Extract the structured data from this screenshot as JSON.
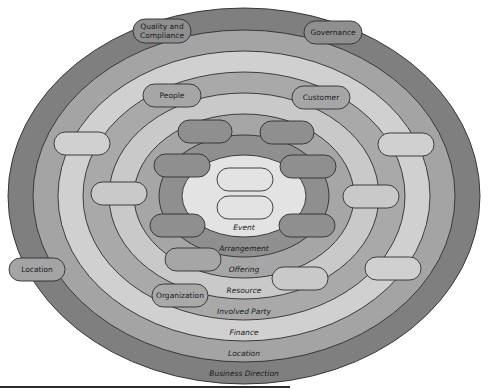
{
  "diagram": {
    "title": "",
    "center": {
      "x": 244,
      "y": 196
    },
    "rings": [
      {
        "label": "Business Direction",
        "color": "#7f7f7f",
        "rx": 236,
        "ry": 188,
        "cy": 196,
        "label_y": 376
      },
      {
        "label": "Location",
        "color": "#a4a4a4",
        "rx": 211,
        "ry": 166,
        "cy": 196,
        "label_y": 356
      },
      {
        "label": "Finance",
        "color": "#d0d0d0",
        "rx": 186,
        "ry": 145,
        "cy": 196,
        "label_y": 335
      },
      {
        "label": "Involved Party",
        "color": "#a9a9a9",
        "rx": 161,
        "ry": 124,
        "cy": 196,
        "label_y": 314
      },
      {
        "label": "Resource",
        "color": "#c9c9c9",
        "rx": 135,
        "ry": 103,
        "cy": 196,
        "label_y": 293
      },
      {
        "label": "Offering",
        "color": "#a6a6a6",
        "rx": 110,
        "ry": 82,
        "cy": 196,
        "label_y": 272
      },
      {
        "label": "Arrangement",
        "color": "#8f8f8f",
        "rx": 85,
        "ry": 61,
        "cy": 196,
        "label_y": 251
      },
      {
        "label": "Event",
        "color": "#e3e3e3",
        "rx": 62,
        "ry": 41,
        "cy": 196,
        "label_y": 230
      }
    ],
    "pills": [
      {
        "label": "Quality and Compliance",
        "lines": [
          "Quality and",
          "Compliance"
        ],
        "x": 133,
        "y": 19,
        "w": 58,
        "h": 24,
        "color": "#8f8f8f"
      },
      {
        "label": "Governance",
        "lines": [
          "Governance"
        ],
        "x": 304,
        "y": 21,
        "w": 58,
        "h": 23,
        "color": "#8f8f8f"
      },
      {
        "label": "People",
        "lines": [
          "People"
        ],
        "x": 143,
        "y": 84,
        "w": 58,
        "h": 23,
        "color": "#a6a6a6"
      },
      {
        "label": "Customer",
        "lines": [
          "Customer"
        ],
        "x": 292,
        "y": 86,
        "w": 58,
        "h": 23,
        "color": "#a6a6a6"
      },
      {
        "label": "",
        "lines": [],
        "x": 54,
        "y": 132,
        "w": 56,
        "h": 23,
        "color": "#d0d0d0"
      },
      {
        "label": "",
        "lines": [],
        "x": 378,
        "y": 133,
        "w": 56,
        "h": 23,
        "color": "#d0d0d0"
      },
      {
        "label": "",
        "lines": [],
        "x": 178,
        "y": 120,
        "w": 54,
        "h": 23,
        "color": "#8f8f8f"
      },
      {
        "label": "",
        "lines": [],
        "x": 260,
        "y": 121,
        "w": 54,
        "h": 23,
        "color": "#8f8f8f"
      },
      {
        "label": "",
        "lines": [],
        "x": 154,
        "y": 154,
        "w": 56,
        "h": 23,
        "color": "#8f8f8f"
      },
      {
        "label": "",
        "lines": [],
        "x": 280,
        "y": 155,
        "w": 56,
        "h": 23,
        "color": "#8f8f8f"
      },
      {
        "label": "",
        "lines": [],
        "x": 91,
        "y": 182,
        "w": 56,
        "h": 23,
        "color": "#c9c9c9"
      },
      {
        "label": "",
        "lines": [],
        "x": 343,
        "y": 185,
        "w": 56,
        "h": 23,
        "color": "#c9c9c9"
      },
      {
        "label": "",
        "lines": [],
        "x": 217,
        "y": 168,
        "w": 56,
        "h": 23,
        "color": "#e3e3e3"
      },
      {
        "label": "",
        "lines": [],
        "x": 217,
        "y": 196,
        "w": 56,
        "h": 23,
        "color": "#e3e3e3"
      },
      {
        "label": "",
        "lines": [],
        "x": 150,
        "y": 214,
        "w": 55,
        "h": 23,
        "color": "#8f8f8f"
      },
      {
        "label": "",
        "lines": [],
        "x": 279,
        "y": 214,
        "w": 56,
        "h": 23,
        "color": "#8f8f8f"
      },
      {
        "label": "",
        "lines": [],
        "x": 165,
        "y": 248,
        "w": 56,
        "h": 23,
        "color": "#a6a6a6"
      },
      {
        "label": "",
        "lines": [],
        "x": 272,
        "y": 267,
        "w": 56,
        "h": 23,
        "color": "#c9c9c9"
      },
      {
        "label": "",
        "lines": [],
        "x": 365,
        "y": 257,
        "w": 56,
        "h": 23,
        "color": "#d0d0d0"
      },
      {
        "label": "Location",
        "lines": [
          "Location"
        ],
        "x": 9,
        "y": 258,
        "w": 56,
        "h": 23,
        "color": "#a4a4a4"
      },
      {
        "label": "Organization",
        "lines": [
          "Organization"
        ],
        "x": 152,
        "y": 284,
        "w": 56,
        "h": 23,
        "color": "#a9a9a9"
      }
    ]
  }
}
